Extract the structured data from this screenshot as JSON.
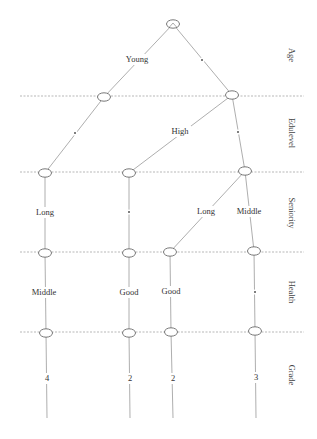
{
  "diagram": {
    "type": "decision-tree",
    "levels": [
      {
        "name": "Age",
        "y": 55
      },
      {
        "name": "Edulevel",
        "y": 133
      },
      {
        "name": "Seniority",
        "y": 213
      },
      {
        "name": "Health",
        "y": 292
      },
      {
        "name": "Grade",
        "y": 375
      }
    ],
    "nodes": [
      {
        "id": "root",
        "x": 173,
        "y": 24
      },
      {
        "id": "n1a",
        "x": 104,
        "y": 97
      },
      {
        "id": "n1b",
        "x": 232,
        "y": 95
      },
      {
        "id": "n2a",
        "x": 45,
        "y": 173
      },
      {
        "id": "n2b",
        "x": 129,
        "y": 173
      },
      {
        "id": "n2c",
        "x": 245,
        "y": 171
      },
      {
        "id": "n3a",
        "x": 45,
        "y": 253
      },
      {
        "id": "n3b",
        "x": 129,
        "y": 253
      },
      {
        "id": "n3c",
        "x": 170,
        "y": 252
      },
      {
        "id": "n3d",
        "x": 254,
        "y": 251
      },
      {
        "id": "n4a",
        "x": 46,
        "y": 333
      },
      {
        "id": "n4b",
        "x": 129,
        "y": 333
      },
      {
        "id": "n4c",
        "x": 171,
        "y": 332
      },
      {
        "id": "n4d",
        "x": 255,
        "y": 331
      }
    ],
    "edges": [
      {
        "from": "root",
        "to": "n1a",
        "label": "Young",
        "lx": 137,
        "ly": 62
      },
      {
        "from": "root",
        "to": "n1b",
        "label": "*",
        "lx": 202,
        "ly": 62
      },
      {
        "from": "n1a",
        "to": "n2a",
        "label": "*",
        "lx": 75,
        "ly": 135
      },
      {
        "from": "n1b",
        "to": "n2b",
        "label": "High",
        "lx": 180,
        "ly": 134
      },
      {
        "from": "n1b",
        "to": "n2c",
        "label": "*",
        "lx": 238,
        "ly": 134
      },
      {
        "from": "n2a",
        "to": "n3a",
        "label": "Long",
        "lx": 45,
        "ly": 215
      },
      {
        "from": "n2b",
        "to": "n3b",
        "label": "*",
        "lx": 129,
        "ly": 214
      },
      {
        "from": "n2c",
        "to": "n3c",
        "label": "Long",
        "lx": 206,
        "ly": 214
      },
      {
        "from": "n2c",
        "to": "n3d",
        "label": "Middle",
        "lx": 249,
        "ly": 214
      },
      {
        "from": "n3a",
        "to": "n4a",
        "label": "Middle",
        "lx": 44,
        "ly": 295
      },
      {
        "from": "n3b",
        "to": "n4b",
        "label": "Good",
        "lx": 129,
        "ly": 295
      },
      {
        "from": "n3c",
        "to": "n4c",
        "label": "Good",
        "lx": 171,
        "ly": 294
      },
      {
        "from": "n3d",
        "to": "n4d",
        "label": "*",
        "lx": 255,
        "ly": 294
      }
    ],
    "leaves": [
      {
        "from": "n4a",
        "value": "4",
        "x": 47,
        "ly": 381,
        "ey": 418
      },
      {
        "from": "n4b",
        "value": "2",
        "x": 130,
        "ly": 381,
        "ey": 418
      },
      {
        "from": "n4c",
        "value": "2",
        "x": 173,
        "ly": 381,
        "ey": 418
      },
      {
        "from": "n4d",
        "value": "3",
        "x": 256,
        "ly": 380,
        "ey": 418
      }
    ],
    "separators": [
      96,
      172,
      252,
      332
    ]
  }
}
